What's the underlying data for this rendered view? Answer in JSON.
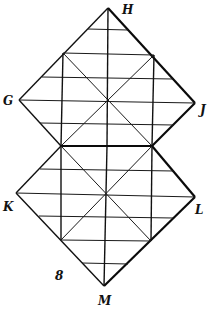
{
  "diagram": {
    "type": "net-of-two-folded-squares",
    "labels": {
      "H": "H",
      "G": "G",
      "J": "J",
      "K": "K",
      "L": "L",
      "M": "M",
      "num": "8"
    },
    "colors": {
      "line": "#1a1a1a",
      "background": "#ffffff"
    }
  }
}
